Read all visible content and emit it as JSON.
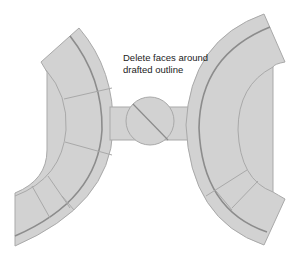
{
  "annotation": {
    "line1": "Delete faces around",
    "line2": "drafted outline"
  },
  "colors": {
    "face_fill": "#d2d2d2",
    "edge": "#a9a9a9",
    "dark_edge": "#8c8c8c",
    "background": "#ffffff",
    "text": "#222222"
  }
}
